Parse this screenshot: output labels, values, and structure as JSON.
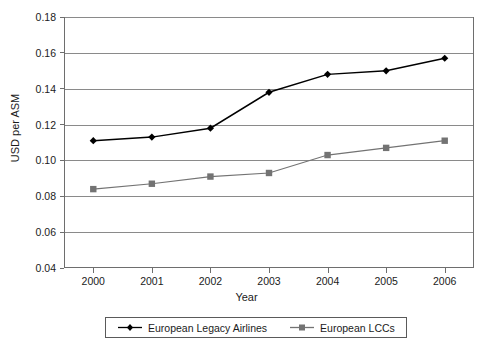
{
  "chart_data": {
    "type": "line",
    "title": "",
    "xlabel": "Year",
    "ylabel": "USD per ASM",
    "categories": [
      "2000",
      "2001",
      "2002",
      "2003",
      "2004",
      "2005",
      "2006"
    ],
    "x": [
      2000,
      2001,
      2002,
      2003,
      2004,
      2005,
      2006
    ],
    "ylim": [
      0.04,
      0.18
    ],
    "xlim": [
      2000,
      2006
    ],
    "yticks": [
      "0.04",
      "0.06",
      "0.08",
      "0.10",
      "0.12",
      "0.14",
      "0.16",
      "0.18"
    ],
    "ytick_values": [
      0.04,
      0.06,
      0.08,
      0.1,
      0.12,
      0.14,
      0.16,
      0.18
    ],
    "grid": "horizontal",
    "legend_position": "bottom",
    "series": [
      {
        "name": "European Legacy Airlines",
        "marker": "diamond",
        "color": "#000000",
        "values": [
          0.111,
          0.113,
          0.118,
          0.138,
          0.148,
          0.15,
          0.157
        ]
      },
      {
        "name": "European LCCs",
        "marker": "square",
        "color": "#737373",
        "values": [
          0.084,
          0.087,
          0.091,
          0.093,
          0.103,
          0.107,
          0.111
        ]
      }
    ]
  },
  "axes": {
    "y_title": "USD per ASM",
    "x_title": "Year"
  },
  "legend": {
    "entries": [
      {
        "label": "European Legacy Airlines",
        "marker": "diamond-marker",
        "color": "#000000"
      },
      {
        "label": "European LCCs",
        "marker": "square-marker",
        "color": "#737373"
      }
    ]
  },
  "colors": {
    "legacy": "#000000",
    "lcc": "#737373",
    "grid": "#8a8a8a",
    "frame": "#6e6e6e",
    "text": "#1b1b1b"
  }
}
